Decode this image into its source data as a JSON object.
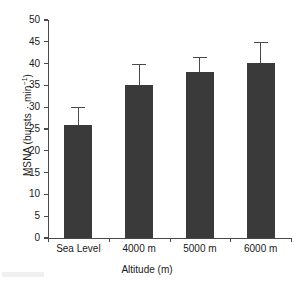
{
  "chart_data": {
    "type": "bar",
    "title": "",
    "categories": [
      "Sea Level",
      "4000 m",
      "5000 m",
      "6000 m"
    ],
    "values": [
      26.0,
      35.0,
      38.0,
      40.2
    ],
    "errors_upper": [
      4.0,
      5.0,
      3.5,
      4.8
    ],
    "series": [
      {
        "name": "MSNA",
        "values": [
          26.0,
          35.0,
          38.0,
          40.2
        ],
        "errors_upper": [
          4.0,
          5.0,
          3.5,
          4.8
        ]
      }
    ],
    "xlabel": "Altitude (m)",
    "ylabel_prefix": "MSNA (bursts ",
    "ylabel_mid": "·",
    "ylabel_unit": " min",
    "ylabel_exponent": "−1",
    "ylabel_suffix": ")",
    "ylabel_full": "MSNA (bursts · min−1)",
    "ylim": [
      0,
      50
    ],
    "ytick_values": [
      "50",
      "45",
      "40",
      "35",
      "30",
      "25",
      "20",
      "15",
      "10",
      "5",
      "0"
    ],
    "grid": false,
    "legend": "none",
    "error_bar_style": "upper-only-with-cap",
    "bar_color": "#3a3a3a",
    "axis_color": "#4a4a4a",
    "background_color": "#ffffff"
  }
}
